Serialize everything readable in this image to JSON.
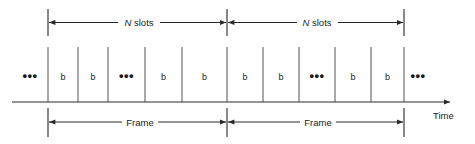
{
  "figure": {
    "background_color": "#ffffff",
    "line_color": "#2a2a2a",
    "text_color": "#1a1a1a",
    "width": 475,
    "height": 144
  },
  "top_measures": [
    {
      "id": "slots-left",
      "italic_symbol": "N",
      "label": " slots",
      "x_start": 48,
      "x_end": 227
    },
    {
      "id": "slots-right",
      "italic_symbol": "N",
      "label": " slots",
      "x_start": 227,
      "x_end": 404
    }
  ],
  "bottom_measures": [
    {
      "id": "frame-left",
      "label": "Frame",
      "x_start": 48,
      "x_end": 227
    },
    {
      "id": "frame-right",
      "label": "Frame",
      "x_start": 227,
      "x_end": 404
    }
  ],
  "axis": {
    "label": "Time",
    "y": 102,
    "x_start": 12,
    "x_end": 452
  },
  "leading_ellipsis": {
    "text": "•••",
    "x": 30
  },
  "trailing_ellipsis": {
    "text": "•••",
    "x": 418
  },
  "frames": [
    {
      "name": "frame-left",
      "boundary_lines": [
        48,
        78,
        108,
        145,
        182,
        227
      ],
      "cells": [
        {
          "label": "b",
          "center": 63
        },
        {
          "label": "b",
          "center": 93
        },
        {
          "label": "•••",
          "center": 126.5,
          "is_ellipsis": true
        },
        {
          "label": "b",
          "center": 163.5
        },
        {
          "label": "b",
          "center": 204.5
        }
      ]
    },
    {
      "name": "frame-right",
      "boundary_lines": [
        227,
        263,
        299,
        335,
        371,
        404
      ],
      "cells": [
        {
          "label": "b",
          "center": 245
        },
        {
          "label": "b",
          "center": 281
        },
        {
          "label": "•••",
          "center": 317,
          "is_ellipsis": true
        },
        {
          "label": "b",
          "center": 353
        },
        {
          "label": "b",
          "center": 387.5
        }
      ]
    }
  ]
}
